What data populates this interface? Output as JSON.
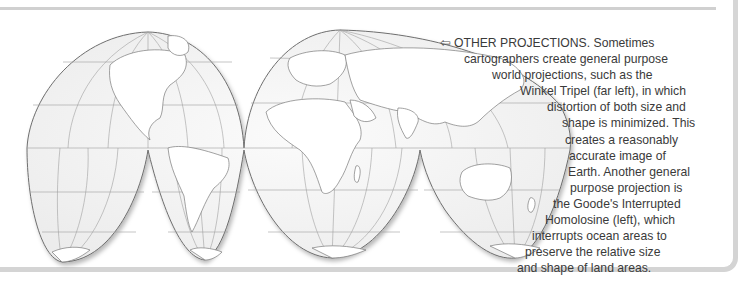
{
  "figure": {
    "name": "Goode's Interrupted Homolosine world map",
    "colors": {
      "ocean": "#f3f3f3",
      "land": "#ffffff",
      "outline": "#6e6e6e",
      "graticule": "#9a9a9a",
      "frame": "#d4d4d4",
      "text": "#3a3a3a"
    }
  },
  "caption": {
    "arrow_icon": "⇦",
    "heading": "OTHER PROJECTIONS.",
    "lines": [
      "Sometimes",
      "cartographers create general purpose",
      "world projections, such as the",
      "Winkel Tripel (far left), in which",
      "distortion of both size and",
      "shape is minimized. This",
      "creates a reasonably",
      "accurate image of",
      "Earth. Another general",
      "purpose projection is",
      "the Goode's Interrupted",
      "Homolosine (left), which",
      "interrupts ocean areas to",
      "preserve the relative size",
      "and shape of land areas."
    ]
  }
}
